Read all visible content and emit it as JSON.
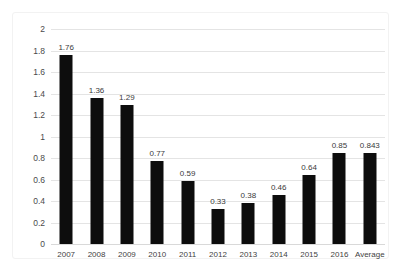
{
  "chart_data": {
    "type": "bar",
    "title": "",
    "subtitle": "",
    "xlabel": "",
    "ylabel": "",
    "categories": [
      "2007",
      "2008",
      "2009",
      "2010",
      "2011",
      "2012",
      "2013",
      "2014",
      "2015",
      "2016",
      "Average"
    ],
    "values": [
      1.76,
      1.36,
      1.29,
      0.77,
      0.59,
      0.33,
      0.38,
      0.46,
      0.64,
      0.85,
      0.843
    ],
    "data_labels": [
      "1.76",
      "1.36",
      "1.29",
      "0.77",
      "0.59",
      "0.33",
      "0.38",
      "0.46",
      "0.64",
      "0.85",
      "0.843"
    ],
    "ylim": [
      0,
      2
    ],
    "ytick_values": [
      0,
      0.2,
      0.4,
      0.6,
      0.8,
      1,
      1.2,
      1.4,
      1.6,
      1.8,
      2
    ],
    "ytick_labels": [
      "0",
      "0.2",
      "0.4",
      "0.6",
      "0.8",
      "1",
      "1.2",
      "1.4",
      "1.6",
      "1.8",
      "2"
    ],
    "grid": true,
    "grid_axis": "y",
    "legend": false,
    "legend_position": "none",
    "bar_color": "#0d0d0d",
    "grid_color": "#e4e4e4",
    "background_color": "#ffffff",
    "show_data_labels": true
  }
}
